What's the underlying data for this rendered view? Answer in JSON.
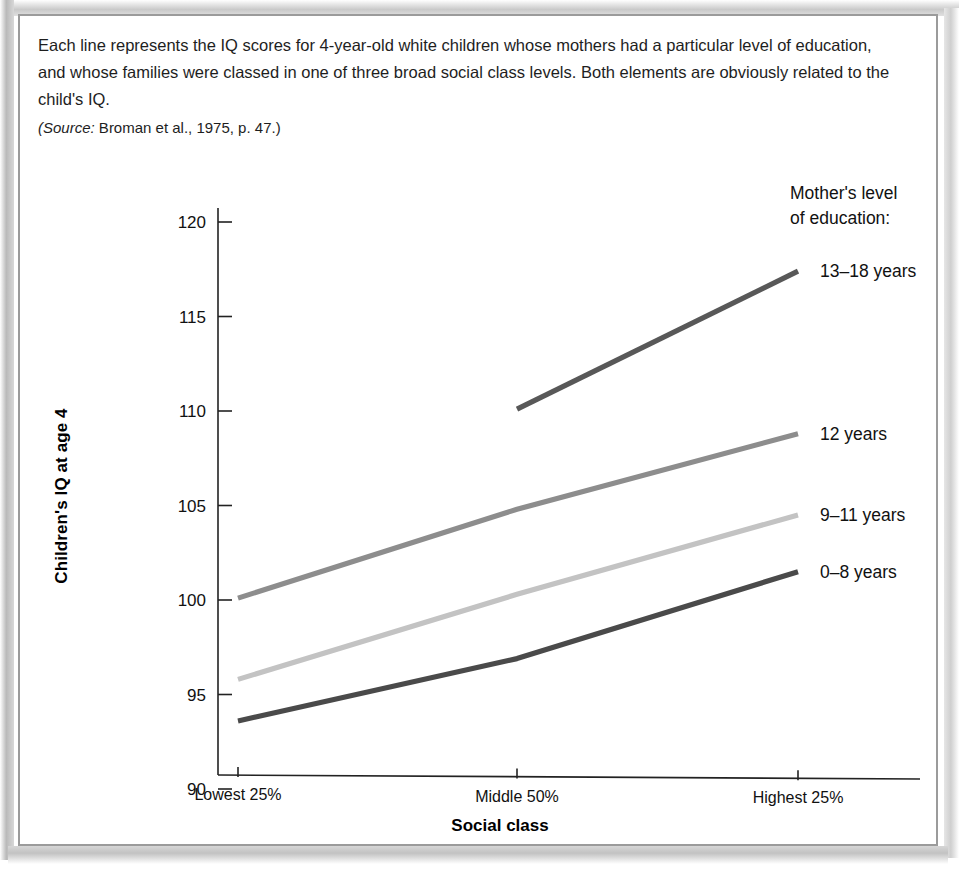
{
  "figure": {
    "clipped_heading": "",
    "caption": "Each line represents the IQ scores for 4-year-old white children whose mothers had a particular level of education, and whose families were classed in one of three broad social class levels. Both elements are obviously related to the child's IQ.",
    "source_label": "(Source:",
    "source_text": " Broman et al., 1975, p. 47.)"
  },
  "legend": {
    "title_line1": "Mother's level",
    "title_line2": "of education:"
  },
  "colors": {
    "line_13_18": "#585858",
    "line_12": "#8d8d8d",
    "line_9_11": "#c3c3c3",
    "line_0_8": "#4a4a4a",
    "axis": "#222222",
    "frame": "#9b9b9b",
    "page_background": "#ffffff"
  },
  "chart_data": {
    "type": "line",
    "title": "",
    "xlabel": "Social class",
    "ylabel": "Children's IQ at age 4",
    "categories": [
      "Lowest 25%",
      "Middle 50%",
      "Highest 25%"
    ],
    "yticks": [
      90,
      95,
      100,
      105,
      110,
      115,
      120
    ],
    "ytick_labels": [
      "90",
      "95",
      "100",
      "105",
      "110",
      "115",
      "120"
    ],
    "ylim": [
      90,
      120
    ],
    "grid": false,
    "legend_position": "right-of-line-ends",
    "series": [
      {
        "name": "13–18 years",
        "color": "#585858",
        "values": [
          null,
          110.1,
          117.4
        ]
      },
      {
        "name": "12 years",
        "color": "#8d8d8d",
        "values": [
          100.1,
          104.8,
          108.8
        ]
      },
      {
        "name": "9–11 years",
        "color": "#c3c3c3",
        "values": [
          95.8,
          100.3,
          104.5
        ]
      },
      {
        "name": "0–8 years",
        "color": "#4a4a4a",
        "values": [
          93.6,
          96.9,
          101.5
        ]
      }
    ]
  }
}
